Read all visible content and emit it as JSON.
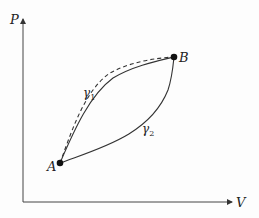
{
  "diagram": {
    "type": "pv-diagram",
    "axes": {
      "y_label": "P",
      "x_label": "V"
    },
    "points": [
      {
        "id": "A",
        "label": "A"
      },
      {
        "id": "B",
        "label": "B"
      }
    ],
    "paths": [
      {
        "id": "gamma1",
        "label": "γ₁",
        "label_base": "γ",
        "label_sub": "1",
        "style": "solid",
        "from": "A",
        "to": "B"
      },
      {
        "id": "gamma2",
        "label": "γ₂",
        "label_base": "γ",
        "label_sub": "2",
        "style": "solid",
        "from": "A",
        "to": "B"
      },
      {
        "id": "dashed",
        "label": "",
        "style": "dashed",
        "from": "A",
        "to": "B"
      }
    ],
    "colors": {
      "line": "#333333",
      "background": "#fdfdfd"
    }
  }
}
